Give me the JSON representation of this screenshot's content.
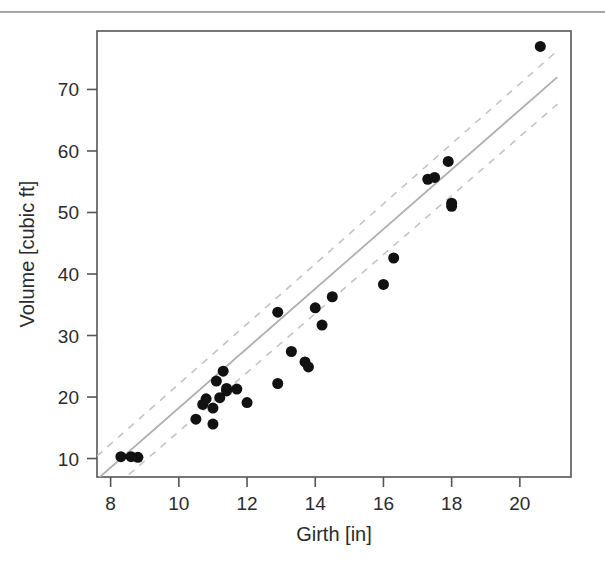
{
  "figure": {
    "name": "girth-volume-scatter",
    "background_color": "#ffffff",
    "point_color": "#111111",
    "fit_color": "#b0b0b0",
    "band_color": "#c4c4c4"
  },
  "chart_data": {
    "type": "scatter",
    "title": "",
    "xlabel": "Girth [in]",
    "ylabel": "Volume [cubic ft]",
    "xlim": [
      7.6,
      21.5
    ],
    "ylim": [
      7.0,
      79.5
    ],
    "xticks": [
      8,
      10,
      12,
      14,
      16,
      18,
      20
    ],
    "xtick_labels": [
      "8",
      "10",
      "12",
      "14",
      "16",
      "18",
      "20"
    ],
    "yticks": [
      10,
      20,
      30,
      40,
      50,
      60,
      70
    ],
    "ytick_labels": [
      "10",
      "20",
      "30",
      "40",
      "50",
      "60",
      "70"
    ],
    "grid": false,
    "legend": null,
    "x": [
      8.3,
      8.6,
      8.8,
      10.5,
      10.7,
      10.8,
      11.0,
      11.0,
      11.1,
      11.2,
      11.3,
      11.4,
      11.4,
      11.7,
      12.0,
      12.9,
      12.9,
      13.3,
      13.7,
      13.8,
      14.0,
      14.2,
      14.5,
      16.0,
      16.3,
      17.3,
      17.5,
      17.9,
      18.0,
      18.0,
      20.6
    ],
    "y": [
      10.3,
      10.3,
      10.2,
      16.4,
      18.8,
      19.7,
      15.6,
      18.2,
      22.6,
      19.9,
      24.2,
      21.0,
      21.4,
      21.3,
      19.1,
      22.2,
      33.8,
      27.4,
      25.7,
      24.9,
      34.5,
      31.7,
      36.3,
      38.3,
      42.6,
      55.4,
      55.7,
      58.3,
      51.5,
      51.0,
      77.0
    ],
    "series": [
      {
        "name": "observations",
        "marker": "filled-circle",
        "marker_size_px": 11,
        "color": "#111111"
      },
      {
        "name": "linear-fit",
        "style": "solid",
        "color": "#b0b0b0",
        "endpoints": [
          {
            "x": 7.6,
            "y": 6.6
          },
          {
            "x": 21.1,
            "y": 72.0
          }
        ]
      },
      {
        "name": "confidence-band-upper",
        "style": "dashed",
        "color": "#c4c4c4",
        "endpoints": [
          {
            "x": 7.6,
            "y": 10.4
          },
          {
            "x": 21.1,
            "y": 76.3
          }
        ]
      },
      {
        "name": "confidence-band-lower",
        "style": "dashed",
        "color": "#c4c4c4",
        "endpoints": [
          {
            "x": 7.6,
            "y": 2.9
          },
          {
            "x": 21.1,
            "y": 67.6
          }
        ]
      }
    ]
  }
}
